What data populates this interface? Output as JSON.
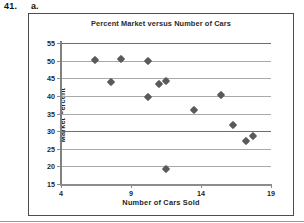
{
  "problem": {
    "number": "41.",
    "part": "a."
  },
  "chart_data": {
    "type": "scatter",
    "title": "Percent Market versus Number of Cars",
    "xlabel": "Number of Cars Sold",
    "ylabel": "Market Percent",
    "xlim": [
      4,
      19
    ],
    "ylim": [
      15,
      55
    ],
    "xticks": [
      4,
      9,
      14,
      19
    ],
    "yticks": [
      15,
      20,
      25,
      30,
      35,
      40,
      45,
      50,
      55
    ],
    "grid": "horizontal",
    "legend": "none",
    "marker": "diamond",
    "marker_color": "#5a5a5a",
    "points": [
      {
        "x": 6.4,
        "y": 50.3
      },
      {
        "x": 7.6,
        "y": 44.0
      },
      {
        "x": 8.3,
        "y": 50.5
      },
      {
        "x": 10.2,
        "y": 50.0
      },
      {
        "x": 10.2,
        "y": 39.6
      },
      {
        "x": 11.0,
        "y": 43.3
      },
      {
        "x": 11.5,
        "y": 44.1
      },
      {
        "x": 11.5,
        "y": 19.3
      },
      {
        "x": 13.5,
        "y": 35.9
      },
      {
        "x": 15.4,
        "y": 40.2
      },
      {
        "x": 16.3,
        "y": 31.7
      },
      {
        "x": 17.2,
        "y": 27.2
      },
      {
        "x": 17.7,
        "y": 28.7
      }
    ]
  }
}
